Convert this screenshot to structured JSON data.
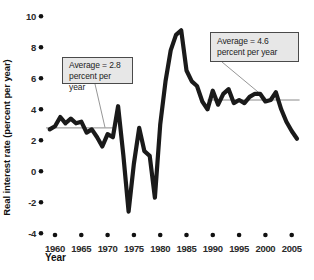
{
  "figure": {
    "y_axis": {
      "title": "Real interest rate (percent per year)",
      "ticks": [
        10,
        8,
        6,
        4,
        2,
        0,
        -2,
        -4
      ]
    },
    "x_axis": {
      "title": "Year",
      "ticks": [
        1960,
        1965,
        1970,
        1975,
        1980,
        1985,
        1990,
        1995,
        2000,
        2005
      ]
    },
    "annotations": [
      {
        "line1": "Average = 2.8",
        "line2": "percent per year"
      },
      {
        "line1": "Average = 4.6",
        "line2": "percent per year"
      }
    ]
  },
  "chart_data": {
    "type": "line",
    "title": "",
    "xlabel": "Year",
    "ylabel": "Real interest rate (percent per year)",
    "xlim": [
      1958,
      2007
    ],
    "ylim": [
      -4,
      10
    ],
    "x_ticks": [
      1960,
      1965,
      1970,
      1975,
      1980,
      1985,
      1990,
      1995,
      2000,
      2005
    ],
    "y_ticks": [
      10,
      8,
      6,
      4,
      2,
      0,
      -2,
      -4
    ],
    "grid": false,
    "line_color": "#1a1a1a",
    "accent_gray": "#8a8a8a",
    "series": [
      {
        "name": "Real interest rate",
        "x": [
          1959,
          1960,
          1961,
          1962,
          1963,
          1964,
          1965,
          1966,
          1967,
          1968,
          1969,
          1970,
          1971,
          1972,
          1973,
          1974,
          1975,
          1976,
          1977,
          1978,
          1979,
          1980,
          1981,
          1982,
          1983,
          1984,
          1985,
          1986,
          1987,
          1988,
          1989,
          1990,
          1991,
          1992,
          1993,
          1994,
          1995,
          1996,
          1997,
          1998,
          1999,
          2000,
          2001,
          2002,
          2003,
          2004,
          2005,
          2006
        ],
        "values": [
          2.7,
          2.9,
          3.5,
          3.1,
          3.4,
          3.1,
          3.2,
          2.5,
          2.7,
          2.2,
          1.6,
          2.4,
          2.2,
          4.2,
          1.0,
          -2.6,
          0.5,
          2.8,
          1.3,
          1.0,
          -1.7,
          3.0,
          5.8,
          7.8,
          8.8,
          9.1,
          6.5,
          5.8,
          5.5,
          4.5,
          4.0,
          5.2,
          4.3,
          5.0,
          5.3,
          4.4,
          4.6,
          4.4,
          4.8,
          5.0,
          5.0,
          4.5,
          4.6,
          5.1,
          4.0,
          3.2,
          2.6,
          2.1
        ]
      }
    ],
    "average_lines": [
      {
        "label": "Average = 2.8 percent per year",
        "value": 2.8,
        "from_year": 1958.3,
        "to_year": 1971.3
      },
      {
        "label": "Average = 4.6 percent per year",
        "value": 4.6,
        "from_year": 1989.0,
        "to_year": 2006.5
      }
    ]
  }
}
